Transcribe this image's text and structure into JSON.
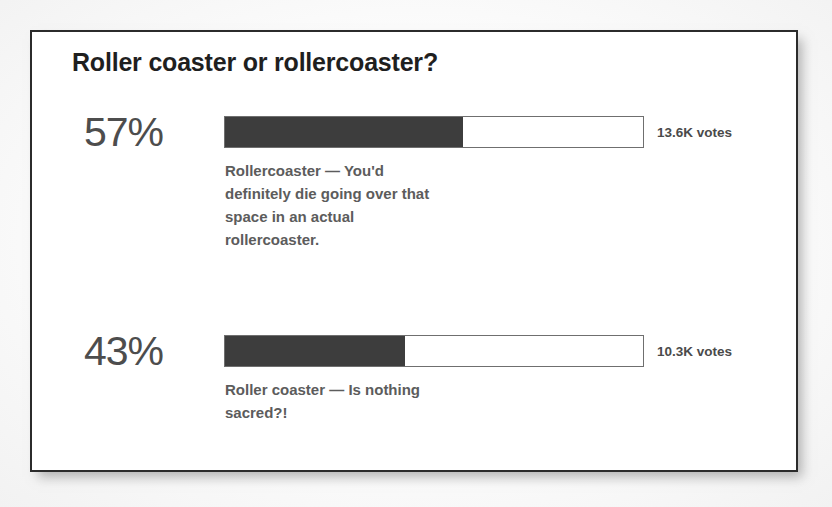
{
  "card": {
    "title": "Roller coaster or rollercoaster?"
  },
  "chart_data": {
    "type": "bar",
    "title": "Roller coaster or rollercoaster?",
    "xlabel": "",
    "ylabel": "",
    "orientation": "horizontal",
    "xlim": [
      0,
      100
    ],
    "grid": false,
    "legend": false,
    "value_unit": "percent",
    "categories": [
      "Rollercoaster — You'd definitely die going over that space in an actual rollercoaster.",
      "Roller coaster — Is nothing sacred?!"
    ],
    "values": [
      57,
      43
    ],
    "value_labels": [
      "57%",
      "43%"
    ],
    "annotations": [
      "13.6K votes",
      "10.3K votes"
    ],
    "vote_counts": [
      13600,
      10300
    ],
    "total_votes": "23.9K",
    "colors": {
      "bar_fill": "#3d3d3d",
      "bar_track": "#ffffff",
      "bar_border": "#6f6f6f",
      "percent_text": "#4d4d4d",
      "title_text": "#1f1f1f",
      "description_text": "#5c5c5c",
      "card_border": "#2b2b2b",
      "card_background": "#ffffff",
      "page_background": "#fdfdfd"
    }
  },
  "options": [
    {
      "percent_label": "57%",
      "fill_percent": 57,
      "description": "Rollercoaster — You'd definitely die going over that space in an actual rollercoaster.",
      "votes_label": "13.6K votes"
    },
    {
      "percent_label": "43%",
      "fill_percent": 43,
      "description": "Roller coaster — Is nothing sacred?!",
      "votes_label": "10.3K votes"
    }
  ]
}
